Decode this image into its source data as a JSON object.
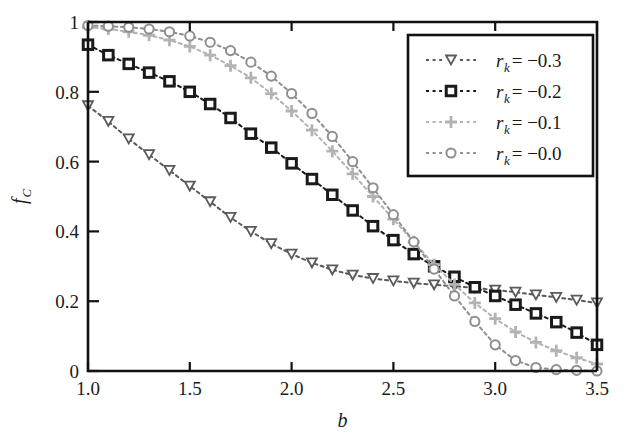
{
  "chart_data": {
    "type": "line",
    "title": "",
    "xlabel": "b",
    "ylabel": "f_C",
    "xlim": [
      1.0,
      3.5
    ],
    "ylim": [
      0.0,
      1.0
    ],
    "grid": false,
    "legend_position": "top-right",
    "x_ticks": [
      "1.0",
      "1.5",
      "2.0",
      "2.5",
      "3.0",
      "3.5"
    ],
    "x_tick_values": [
      1.0,
      1.5,
      2.0,
      2.5,
      3.0,
      3.5
    ],
    "y_ticks": [
      "0",
      "0.2",
      "0.4",
      "0.6",
      "0.8",
      "1"
    ],
    "y_tick_values": [
      0,
      0.2,
      0.4,
      0.6,
      0.8,
      1.0
    ],
    "x": [
      1.0,
      1.1,
      1.2,
      1.3,
      1.4,
      1.5,
      1.6,
      1.7,
      1.8,
      1.9,
      2.0,
      2.1,
      2.2,
      2.3,
      2.4,
      2.5,
      2.6,
      2.7,
      2.8,
      2.9,
      3.0,
      3.1,
      3.2,
      3.3,
      3.4,
      3.5
    ],
    "series": [
      {
        "name": "r_k = -0.3",
        "legend_label_base": "r",
        "legend_label_sub": "k",
        "legend_label_value": "= −0.3",
        "marker": "triangle-down",
        "color": "#5a5a5a",
        "linestyle": "dotted",
        "values": [
          0.76,
          0.715,
          0.665,
          0.62,
          0.575,
          0.53,
          0.485,
          0.44,
          0.4,
          0.365,
          0.335,
          0.31,
          0.29,
          0.275,
          0.265,
          0.258,
          0.252,
          0.247,
          0.243,
          0.238,
          0.232,
          0.226,
          0.218,
          0.211,
          0.203,
          0.195
        ]
      },
      {
        "name": "r_k = -0.2",
        "legend_label_base": "r",
        "legend_label_sub": "k",
        "legend_label_value": "= −0.2",
        "marker": "square",
        "color": "#1a1a1a",
        "linestyle": "dotted",
        "values": [
          0.935,
          0.905,
          0.88,
          0.855,
          0.83,
          0.8,
          0.765,
          0.725,
          0.68,
          0.64,
          0.595,
          0.55,
          0.505,
          0.46,
          0.415,
          0.375,
          0.335,
          0.3,
          0.27,
          0.24,
          0.215,
          0.19,
          0.165,
          0.14,
          0.11,
          0.075
        ]
      },
      {
        "name": "r_k = -0.1",
        "legend_label_base": "r",
        "legend_label_sub": "k",
        "legend_label_value": "= −0.1",
        "marker": "plus",
        "color": "#b3b3b3",
        "linestyle": "dotted",
        "values": [
          0.985,
          0.98,
          0.972,
          0.962,
          0.948,
          0.93,
          0.905,
          0.875,
          0.84,
          0.795,
          0.745,
          0.69,
          0.63,
          0.565,
          0.5,
          0.435,
          0.37,
          0.305,
          0.248,
          0.195,
          0.15,
          0.112,
          0.082,
          0.058,
          0.038,
          0.02
        ]
      },
      {
        "name": "r_k = -0.0",
        "legend_label_base": "r",
        "legend_label_sub": "k",
        "legend_label_value": "= −0.0",
        "marker": "circle",
        "color": "#8f8f8f",
        "linestyle": "dotted",
        "values": [
          0.99,
          0.988,
          0.985,
          0.98,
          0.972,
          0.96,
          0.942,
          0.918,
          0.885,
          0.845,
          0.795,
          0.738,
          0.672,
          0.6,
          0.525,
          0.448,
          0.37,
          0.292,
          0.215,
          0.142,
          0.075,
          0.03,
          0.01,
          0.004,
          0.002,
          0.0
        ]
      }
    ]
  },
  "axes": {
    "x_axis_label": "b",
    "y_axis_label_base": "f",
    "y_axis_label_sub": "C"
  },
  "legend": {
    "entries": [
      {
        "label_base": "r",
        "label_sub": "k",
        "label_value": "= −0.3"
      },
      {
        "label_base": "r",
        "label_sub": "k",
        "label_value": "= −0.2"
      },
      {
        "label_base": "r",
        "label_sub": "k",
        "label_value": "= −0.1"
      },
      {
        "label_base": "r",
        "label_sub": "k",
        "label_value": "= −0.0"
      }
    ]
  }
}
